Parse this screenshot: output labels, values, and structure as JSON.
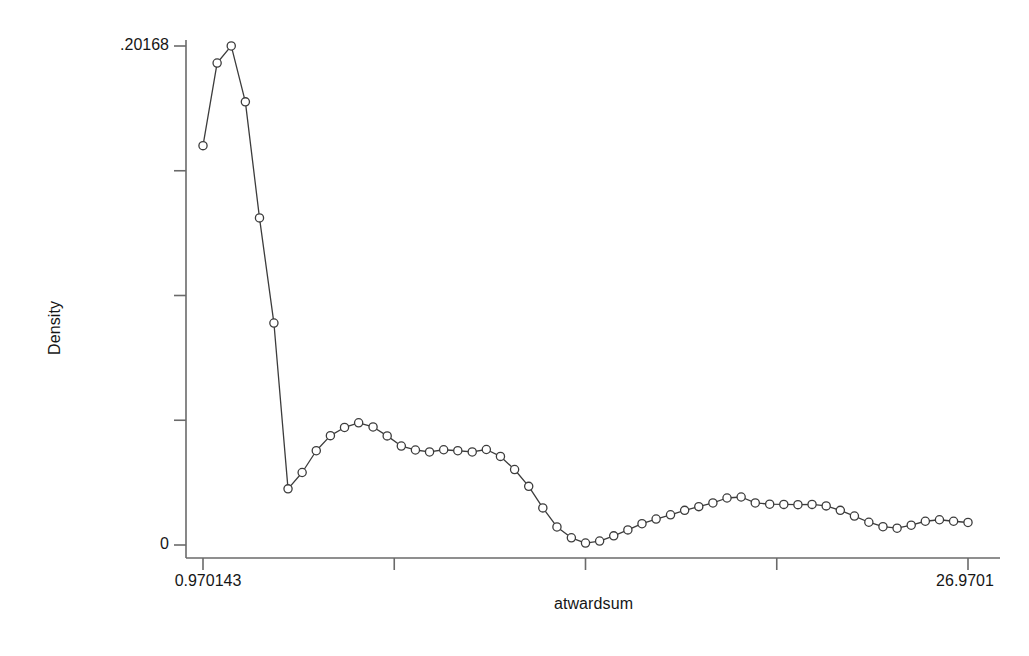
{
  "chart_data": {
    "type": "line",
    "title": "",
    "subtitle": "",
    "xlabel": "atwardsum",
    "ylabel": "Density",
    "grid": false,
    "legend": false,
    "legend_position": "none",
    "marker": "open-circle",
    "line_color": "#3c3c3c",
    "marker_color": "#3c3c3c",
    "background_color": "#ffffff",
    "axis_color": "#6a6a6a",
    "xlim": [
      0.970143,
      26.9701
    ],
    "ylim": [
      0,
      0.20168
    ],
    "x_tick_labels": [
      "0.970143",
      "",
      "",
      "",
      "26.9701"
    ],
    "x_tick_values": [
      0.970143,
      7.470136,
      13.970129,
      20.470122,
      26.9701
    ],
    "y_tick_labels": [
      ".20168",
      "",
      "",
      "",
      "0"
    ],
    "y_tick_values": [
      0.20168,
      0.15126,
      0.10084,
      0.05042,
      0
    ],
    "x_axis_min_label": "0.970143",
    "x_axis_max_label": "26.9701",
    "y_axis_max_label": ".20168",
    "y_axis_min_label": "0",
    "n_points": 55,
    "series": [
      {
        "name": "density",
        "x": [
          0.97,
          1.45,
          1.93,
          2.41,
          2.89,
          3.38,
          3.86,
          4.34,
          4.82,
          5.3,
          5.78,
          6.26,
          6.75,
          7.23,
          7.71,
          8.19,
          8.67,
          9.15,
          9.63,
          10.12,
          10.6,
          11.08,
          11.56,
          12.04,
          12.52,
          13.0,
          13.49,
          13.97,
          14.45,
          14.93,
          15.41,
          15.89,
          16.37,
          16.86,
          17.34,
          17.82,
          18.3,
          18.78,
          19.26,
          19.74,
          20.23,
          20.71,
          21.19,
          21.67,
          22.15,
          22.63,
          23.11,
          23.6,
          24.08,
          24.56,
          25.04,
          25.52,
          26.0,
          26.48,
          26.97
        ],
        "y": [
          0.1614,
          0.1948,
          0.2017,
          0.1791,
          0.1322,
          0.0897,
          0.0227,
          0.0293,
          0.0381,
          0.0442,
          0.0475,
          0.0494,
          0.0477,
          0.0441,
          0.04,
          0.0384,
          0.0376,
          0.0385,
          0.0381,
          0.0376,
          0.0386,
          0.0358,
          0.0305,
          0.0237,
          0.015,
          0.0073,
          0.0029,
          0.0008,
          0.0016,
          0.0037,
          0.0061,
          0.0086,
          0.0105,
          0.0122,
          0.014,
          0.0155,
          0.017,
          0.019,
          0.0194,
          0.017,
          0.0165,
          0.0164,
          0.0163,
          0.0164,
          0.0158,
          0.014,
          0.0117,
          0.0092,
          0.0074,
          0.0068,
          0.008,
          0.0096,
          0.0102,
          0.0096,
          0.0091
        ]
      }
    ],
    "pixel_geometry": {
      "plot_left_x": 203,
      "plot_right_x": 968,
      "plot_zero_y": 545,
      "plot_top_y": 46,
      "axis_line_x": 186,
      "axis_line_y": 558
    }
  },
  "labels": {
    "y_title": "Density",
    "x_title": "atwardsum"
  }
}
